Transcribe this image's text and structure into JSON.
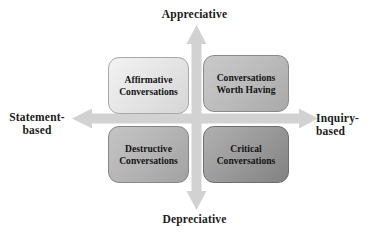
{
  "diagram": {
    "axes": {
      "vertical": {
        "top_label": "Appreciative",
        "bottom_label": "Depreciative",
        "arrow_color": "#cfcfcf"
      },
      "horizontal": {
        "left_label": "Statement-\nbased",
        "right_label": "Inquiry-based",
        "arrow_color": "#cfcfcf"
      }
    },
    "quadrants": [
      {
        "id": "affirmative",
        "label": "Affirmative\nConversations",
        "position": "top-left",
        "fill": "#e6e6e6"
      },
      {
        "id": "conversations-worth-having",
        "label": "Conversations\nWorth Having",
        "position": "top-right",
        "fill": "#bdbdbd"
      },
      {
        "id": "destructive",
        "label": "Destructive\nConversations",
        "position": "bottom-left",
        "fill": "#b6b6b6"
      },
      {
        "id": "critical",
        "label": "Critical\nConversations",
        "position": "bottom-right",
        "fill": "#9c9c9c"
      }
    ]
  }
}
